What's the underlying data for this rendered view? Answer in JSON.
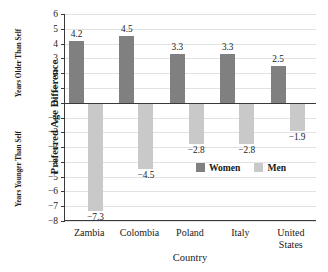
{
  "chart_data": {
    "type": "bar",
    "title": "",
    "xlabel": "Country",
    "ylabel": "Preferred Age Difference",
    "ylabel_upper": "Years Older Than Self",
    "ylabel_lower": "Years Younger Than Self",
    "categories": [
      "Zambia",
      "Colombia",
      "Poland",
      "Italy",
      "United\nStates"
    ],
    "ylim": [
      -8,
      6
    ],
    "yticks": [
      6,
      5,
      4,
      3,
      2,
      1,
      0,
      -1,
      -2,
      -3,
      -4,
      -5,
      -6,
      -7,
      -8
    ],
    "ytick_labels": [
      "6",
      "5",
      "4",
      "3",
      "2",
      "1",
      "0",
      "−1",
      "−2",
      "−3",
      "−4",
      "−5",
      "−6",
      "−7",
      "−8"
    ],
    "grid": true,
    "legend_position": "inside-lower-right",
    "series": [
      {
        "name": "Women",
        "color": "#808080",
        "values": [
          4.2,
          4.5,
          3.3,
          3.3,
          2.5
        ],
        "labels": [
          "4.2",
          "4.5",
          "3.3",
          "3.3",
          "2.5"
        ]
      },
      {
        "name": "Men",
        "color": "#c9c9c9",
        "values": [
          -7.3,
          -4.5,
          -2.8,
          -2.8,
          -1.9
        ],
        "labels": [
          "−7.3",
          "−4.5",
          "−2.8",
          "−2.8",
          "−1.9"
        ]
      }
    ]
  },
  "colors": {
    "women": "#808080",
    "men": "#c9c9c9",
    "axis": "#3a3a3a",
    "grid": "#e2e2e2"
  }
}
